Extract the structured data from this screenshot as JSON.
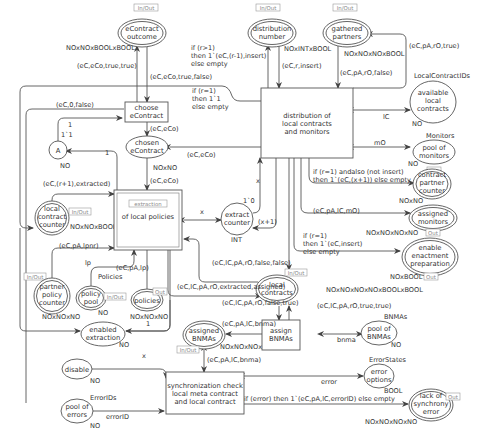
{
  "diagram": {
    "type": "colored-petri-net",
    "places": {
      "econtract_outcome": {
        "label": [
          "eContract",
          "outcome"
        ],
        "type": "NOxNOxBOOLxBOOL",
        "tag": "In/Out",
        "double": true
      },
      "distribution_number": {
        "label": [
          "distribution",
          "number"
        ],
        "type": "NOxINTxBOOL",
        "tag": "In/Out",
        "double": true
      },
      "gathered_partners": {
        "label": [
          "gathered",
          "partners"
        ],
        "type": "NOxNOxNOxBOOL",
        "tag": "In/Out",
        "double": true
      },
      "available_local_contracts": {
        "label": [
          "available",
          "local",
          "contracts"
        ],
        "type": "NO",
        "colorset": "LocalContractIDs"
      },
      "pool_of_monitors": {
        "label": [
          "pool of",
          "monitors"
        ],
        "type": "NO",
        "colorset": "Monitors"
      },
      "contract_partner_counter": {
        "label": [
          "contract",
          "partner",
          "counter"
        ],
        "type": "NOxNO",
        "tag": "Out",
        "double": true
      },
      "assigned_monitors": {
        "label": [
          "assigned",
          "monitors"
        ],
        "type": "NOxNOxNOxNO",
        "tag": "Out",
        "double": true
      },
      "enable_enactment_preparation": {
        "label": [
          "enable",
          "enactment",
          "preparation"
        ],
        "type": "NOxBOOL",
        "tag": "Out",
        "double": true
      },
      "A": {
        "label": [
          "A"
        ],
        "type": "NO",
        "initial": "1`1"
      },
      "chosen_econtract": {
        "label": [
          "chosen",
          "eContract"
        ],
        "type": "NOxNO"
      },
      "local_contract_counter": {
        "label": [
          "local",
          "contract",
          "counter"
        ],
        "type": "NOxNOxBOOL",
        "tag": "In/Out",
        "double": true
      },
      "extract_counter": {
        "label": [
          "extract",
          "counter"
        ],
        "type": "INT",
        "initial": "1`0"
      },
      "partner_policy_counter": {
        "label": [
          "partner",
          "policy",
          "counter"
        ],
        "type": "NOxNOxNO",
        "tag": "In/Out",
        "double": true
      },
      "policy_pool": {
        "label": [
          "policy",
          "pool"
        ],
        "type": "NO",
        "colorset": "Policies",
        "tag": "In/Out",
        "double": true
      },
      "policies": {
        "label": [
          "policies"
        ],
        "type": "NOxNOxNO",
        "tag": "Out",
        "double": true
      },
      "enabled_extraction": {
        "label": [
          "enabled",
          "extraction"
        ],
        "type": "NO"
      },
      "local_contracts": {
        "label": [
          "local",
          "contracts"
        ],
        "type": "NOxNOxNOxNOxBOOLxBOOL",
        "tag": "In/Out",
        "double": true
      },
      "assigned_bnmas": {
        "label": [
          "assigned",
          "BNMAs"
        ],
        "type": "NOxNOxNOxNO",
        "tag": "In/Out",
        "double": true
      },
      "pool_of_bnmas": {
        "label": [
          "pool of",
          "BNMAs"
        ],
        "type": "NO",
        "colorset": "BNMAs"
      },
      "disable": {
        "label": [
          "disable"
        ],
        "type": "NO"
      },
      "pool_of_errors": {
        "label": [
          "pool of",
          "errors"
        ],
        "type": "NO",
        "colorset": "ErrorIDs"
      },
      "error_options": {
        "label": [
          "error",
          "options"
        ],
        "type": "BOOL",
        "colorset": "ErrorStates"
      },
      "lack_of_synchrony_error": {
        "label": [
          "lack of",
          "synchrony",
          "error"
        ],
        "type": "NOxNOxNOxNO",
        "tag": "Out",
        "double": true
      }
    },
    "transitions": {
      "choose_econtract": {
        "label": [
          "choose",
          "eContract"
        ]
      },
      "distribution": {
        "label": [
          "distribution of",
          "local contracts",
          "and monitors"
        ]
      },
      "extraction": {
        "label": [
          "of local policies"
        ],
        "tag": "extraction",
        "substitution": true
      },
      "assign_bnmas": {
        "label": [
          "assign",
          "BNMAs"
        ]
      },
      "sync_check": {
        "label": [
          "synchronization check",
          "local meta contract",
          "and local contract"
        ]
      }
    },
    "arcs": {
      "a1": "(eC,eCo,true,true)",
      "a2": "(eC,eCo,true,false)",
      "a3": [
        "if (r>1)",
        "then 1`(eC,(r-1),insert)",
        "else empty"
      ],
      "a4": "(eC,r,insert)",
      "a5": "(eC,pA,rO,false)",
      "a6": "(eC,pA,rO,true)",
      "a7": [
        "if (r=1)",
        "then 1`1",
        "else empty"
      ],
      "a8": "(eC,0,false)",
      "a9": "1",
      "a10": "(eC,eCo)",
      "a11": "(eC,eCo)",
      "a12": "(eC,eCo)",
      "a13": "lC",
      "a14": "mO",
      "a15": [
        "if (r=1) andalso (not insert)",
        "then 1`(eC,(x+1)) else empty"
      ],
      "a16": "(eC,pA,lC,mO)",
      "a17": [
        "if (r=1)",
        "then 1`(eC,insert)",
        "else empty"
      ],
      "a18": "1",
      "a19": "(eC,(r+1),extracted)",
      "a20": "x",
      "a21": "x",
      "a22": "(x+1)",
      "a23": "(eC,pA,lpnr)",
      "a24": "lp",
      "a25": "(eC,pA,lp)",
      "a26": "(eC,lC,pA,rO,false,false)",
      "a27": "(eC,lC,pA,rO,extracted,assigned)",
      "a28": "(eC,lC,pA,rO,false,true)",
      "a29": "(eC,lC,pA,rO,true,true)",
      "a30": "(eC,pA,lC,bnma)",
      "a31": "bnma",
      "a32": "(eC,pA,lC,bnma)",
      "a33": "1",
      "a34": "x",
      "a35": "errorID",
      "a36": "error",
      "a37": "if (error) then 1`(eC,pA,lC,errorID) else empty"
    }
  }
}
